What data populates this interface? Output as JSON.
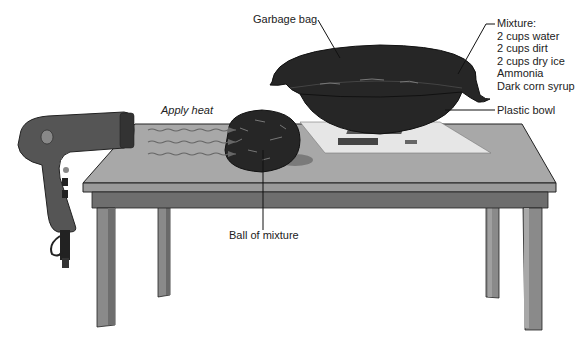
{
  "diagram": {
    "type": "experiment-setup-illustration",
    "labels": {
      "garbage_bag": "Garbage bag",
      "mixture_title": "Mixture:",
      "plastic_bowl": "Plastic bowl",
      "apply_heat": "Apply heat",
      "ball_of_mixture": "Ball of mixture"
    },
    "mixture_ingredients": [
      "2 cups water",
      "2 cups dirt",
      "2 cups dry ice",
      "Ammonia",
      "Dark corn syrup"
    ],
    "objects": [
      "hair-dryer",
      "table",
      "plastic-bowl",
      "garbage-bag",
      "ball-of-mixture",
      "paper-sheet",
      "heat-arrows"
    ],
    "colors": {
      "table_top": "#a8a8a8",
      "table_edge": "#8e8e8e",
      "table_apron": "#6e6e6e",
      "table_leg": "#8a8a8a",
      "dark_object": "#262626",
      "paper": "#e6e6e6",
      "outline": "#222222"
    }
  }
}
